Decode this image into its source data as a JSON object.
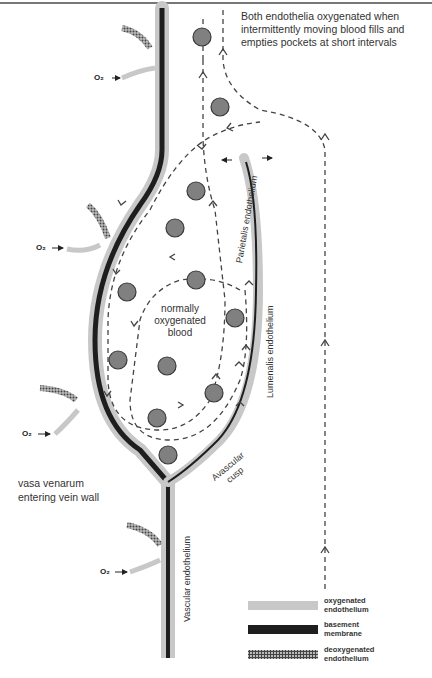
{
  "caption": "Both endothelia oxygenated when intermittently moving blood fills and empties pockets at short intervals",
  "labels": {
    "center": "normally oxygenated blood",
    "center_lines": [
      "normally",
      "oxygenated",
      "blood"
    ],
    "vasa": [
      "vasa venarum",
      "entering vein wall"
    ],
    "parietalis": "Parietalis endothelium",
    "lumenalis": "Lumenalis endothelium",
    "avascular": [
      "Avascular",
      "cusp"
    ],
    "vascular": "Vascular endothelium",
    "o2": "O₂"
  },
  "legend": [
    {
      "label_lines": [
        "oxygenated",
        "endothelium"
      ],
      "style": "light-gray-band",
      "color": "#c8c8c8"
    },
    {
      "label_lines": [
        "basement",
        "membrane"
      ],
      "style": "black-band",
      "color": "#1e1e1e"
    },
    {
      "label_lines": [
        "deoxygenated",
        "endothelium"
      ],
      "style": "checkered-band",
      "color": "#555555"
    }
  ],
  "colors": {
    "oxygenated_endothelium": "#c8c8c8",
    "basement_membrane": "#1e1e1e",
    "blood_cell_fill": "#808080",
    "blood_cell_stroke": "#3a3a3a",
    "flow_line": "#444444"
  },
  "blood_cells": [
    {
      "cx": 202,
      "cy": 37
    },
    {
      "cx": 220,
      "cy": 107
    },
    {
      "cx": 196,
      "cy": 191
    },
    {
      "cx": 175,
      "cy": 228
    },
    {
      "cx": 127,
      "cy": 292
    },
    {
      "cx": 196,
      "cy": 280
    },
    {
      "cx": 235,
      "cy": 318
    },
    {
      "cx": 118,
      "cy": 360
    },
    {
      "cx": 167,
      "cy": 366
    },
    {
      "cx": 214,
      "cy": 393
    },
    {
      "cx": 157,
      "cy": 418
    },
    {
      "cx": 168,
      "cy": 455
    }
  ]
}
